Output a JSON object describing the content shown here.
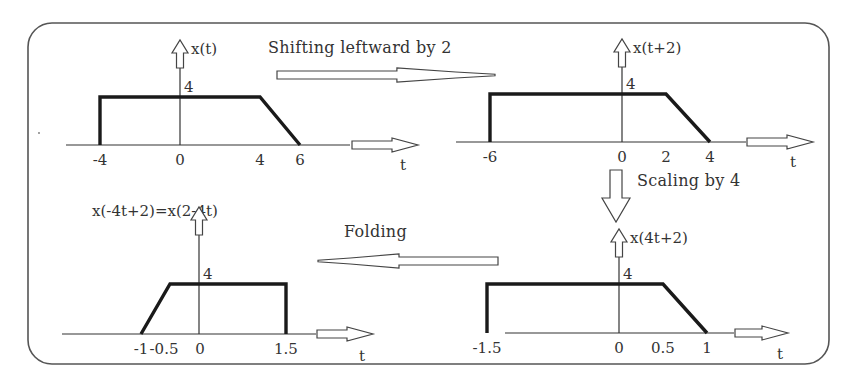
{
  "frame": {
    "x": 28,
    "y": 23,
    "w": 801,
    "h": 341,
    "r": 24
  },
  "colors": {
    "stroke": "#1a1a1a",
    "axis": "#333333",
    "text": "#333333",
    "background": "#ffffff"
  },
  "operations": [
    {
      "id": "shift",
      "label": "Shifting leftward by 2",
      "direction": "right",
      "label_x": 268,
      "label_y": 53,
      "arrow": {
        "x1": 277,
        "x2": 495,
        "y": 75
      }
    },
    {
      "id": "scale",
      "label": "Scaling by 4",
      "direction": "down",
      "label_x": 637,
      "label_y": 186,
      "arrow": {
        "x": 616,
        "y1": 170,
        "y2": 222
      }
    },
    {
      "id": "fold",
      "label": "Folding",
      "direction": "left",
      "label_x": 344,
      "label_y": 237,
      "arrow": {
        "x1": 318,
        "x2": 498,
        "y": 261
      }
    }
  ],
  "chart_data": [
    {
      "type": "line",
      "title": "x(t)",
      "xlabel": "t",
      "ylabel": "x(t)",
      "y_tick": "4",
      "points": [
        [
          -4,
          0
        ],
        [
          -4,
          4
        ],
        [
          4,
          4
        ],
        [
          6,
          0
        ]
      ],
      "x_ticks": [
        "-4",
        "0",
        "4",
        "6"
      ],
      "x_tick_values": [
        -4,
        0,
        4,
        6
      ],
      "layout": {
        "origin_x": 180,
        "axis_y": 145,
        "unit_x": 20,
        "top_y": 97,
        "axis_x0": 66,
        "axis_x1": 350,
        "arrow_x1": 352,
        "arrow_x2": 418,
        "ylabel_x": 195,
        "ylabel_y": 49,
        "t_x": 400,
        "t_y": 170
      }
    },
    {
      "type": "line",
      "title": "x(t+2)",
      "xlabel": "t",
      "ylabel": "x(t+2)",
      "y_tick": "4",
      "points": [
        [
          -6,
          0
        ],
        [
          -6,
          4
        ],
        [
          2,
          4
        ],
        [
          4,
          0
        ]
      ],
      "x_ticks": [
        "-6",
        "0",
        "2",
        "4"
      ],
      "x_tick_values": [
        -6,
        0,
        2,
        4
      ],
      "layout": {
        "origin_x": 622,
        "axis_y": 142,
        "unit_x": 22,
        "top_y": 94,
        "axis_x0": 456,
        "axis_x1": 746,
        "arrow_x1": 747,
        "arrow_x2": 813,
        "ylabel_x": 638,
        "ylabel_y": 48,
        "t_x": 790,
        "t_y": 167
      }
    },
    {
      "type": "line",
      "title": "x(-4t+2)=x(2-4t)",
      "xlabel": "t",
      "ylabel": "x(-4t+2)=x(2-4t)",
      "y_tick": "4",
      "points": [
        [
          -1,
          0
        ],
        [
          -0.5,
          4
        ],
        [
          1.5,
          4
        ],
        [
          1.5,
          0
        ]
      ],
      "x_ticks": [
        "-1",
        "-0.5",
        "0",
        "1.5"
      ],
      "x_tick_values": [
        -1,
        -0.5,
        0,
        1.5
      ],
      "layout": {
        "origin_x": 199,
        "axis_y": 334,
        "unit_x": 58,
        "top_y": 284,
        "axis_x0": 62,
        "axis_x1": 316,
        "arrow_x1": 317,
        "arrow_x2": 373,
        "ylabel_x": 92,
        "ylabel_y": 216,
        "t_x": 359,
        "t_y": 361
      }
    },
    {
      "type": "line",
      "title": "x(4t+2)",
      "xlabel": "t",
      "ylabel": "x(4t+2)",
      "y_tick": "4",
      "points": [
        [
          -1.5,
          0
        ],
        [
          -1.5,
          4
        ],
        [
          0.5,
          4
        ],
        [
          1,
          0
        ]
      ],
      "x_ticks": [
        "-1.5",
        "0",
        "0.5",
        "1"
      ],
      "x_tick_values": [
        -1.5,
        0,
        0.5,
        1
      ],
      "layout": {
        "origin_x": 619,
        "axis_y": 333,
        "unit_x": 88,
        "top_y": 284,
        "axis_x0": 505,
        "axis_x1": 734,
        "arrow_x1": 735,
        "arrow_x2": 788,
        "ylabel_x": 636,
        "ylabel_y": 238,
        "t_x": 777,
        "t_y": 359
      }
    }
  ]
}
